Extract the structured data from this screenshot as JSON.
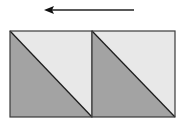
{
  "diagram": {
    "arrow": {
      "direction": "left",
      "x1": 134,
      "y1": 10,
      "x2": 44,
      "y2": 10,
      "color": "#222222"
    },
    "squares": [
      {
        "x": 10,
        "y": 31,
        "w": 82,
        "h": 86,
        "dark_triangle": "lower-left",
        "light_triangle": "upper-right"
      },
      {
        "x": 92,
        "y": 31,
        "w": 83,
        "h": 86,
        "dark_triangle": "lower-left",
        "light_triangle": "upper-right"
      }
    ],
    "colors": {
      "dark_fill": "#a3a3a3",
      "light_fill": "#e8e8e8",
      "stroke": "#2a2a2a"
    }
  }
}
